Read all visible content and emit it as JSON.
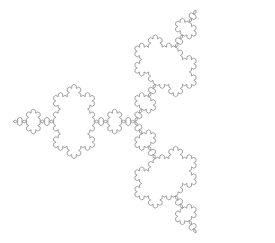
{
  "figure": {
    "description": "Koch snowflake fractal outline",
    "background": "#ffffff",
    "stroke_color": "#8a8a8a",
    "stroke_width": 0.8
  },
  "chart_data": {
    "type": "fractal",
    "title": "",
    "shape": "Koch snowflake",
    "iteration_level": 4,
    "center": [
      135,
      121.5
    ],
    "radius_x": 122,
    "radius_y": 128.7,
    "base_triangle_angles_deg": [
      180,
      60,
      300
    ],
    "star_tip_points": [
      [
        13,
        121
      ],
      [
        72,
        10
      ],
      [
        205,
        10
      ],
      [
        257,
        121
      ],
      [
        205,
        233
      ],
      [
        72,
        233
      ]
    ],
    "notch_points_approx": [
      [
        135,
        48
      ],
      [
        135,
        195
      ]
    ],
    "grid": false,
    "axes": false,
    "legend": false
  }
}
